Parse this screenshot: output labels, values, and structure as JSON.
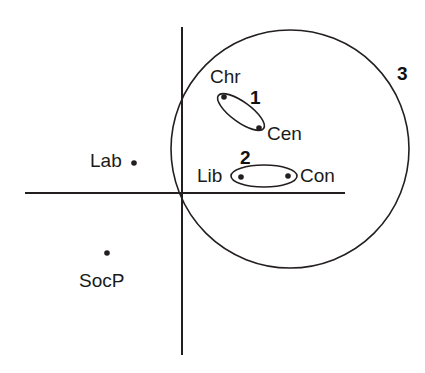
{
  "figure": {
    "background_color": "#ffffff",
    "stroke_color": "#231f20",
    "text_color": "#1a1a1a"
  },
  "chart_data": {
    "type": "scatter",
    "title": "",
    "xlabel": "",
    "ylabel": "",
    "grid": false,
    "legend": "none",
    "axes": {
      "type": "crossing-axes",
      "origin_px": [
        182,
        193
      ],
      "x_axis_px": [
        25,
        345
      ],
      "y_axis_px": [
        27,
        355
      ]
    },
    "xlim": [
      -1.0,
      1.0
    ],
    "ylim": [
      -1.0,
      1.0
    ],
    "points": [
      {
        "label": "Chr",
        "x_px": 224,
        "y_px": 97,
        "label_x_px": 210,
        "label_y_px": 67,
        "label_anchor": "above-left"
      },
      {
        "label": "Cen",
        "x_px": 259,
        "y_px": 128,
        "label_x_px": 267,
        "label_y_px": 124,
        "label_anchor": "right"
      },
      {
        "label": "Lib",
        "x_px": 241,
        "y_px": 177,
        "label_x_px": 197,
        "label_y_px": 166,
        "label_anchor": "left"
      },
      {
        "label": "Con",
        "x_px": 288,
        "y_px": 176,
        "label_x_px": 300,
        "label_y_px": 166,
        "label_anchor": "right"
      },
      {
        "label": "Lab",
        "x_px": 134,
        "y_px": 163,
        "label_x_px": 90,
        "label_y_px": 151,
        "label_anchor": "left"
      },
      {
        "label": "SocP",
        "x_px": 107,
        "y_px": 253,
        "label_x_px": 79,
        "label_y_px": 271,
        "label_anchor": "below"
      }
    ],
    "clusters": [
      {
        "id": "1",
        "shape": "ellipse",
        "members": [
          "Chr",
          "Cen"
        ],
        "cx_px": 241,
        "cy_px": 112,
        "rx_px": 28,
        "ry_px": 10,
        "rotation_deg": 36,
        "label_x_px": 250,
        "label_y_px": 88
      },
      {
        "id": "2",
        "shape": "ellipse",
        "members": [
          "Lib",
          "Con"
        ],
        "cx_px": 264,
        "cy_px": 176,
        "rx_px": 33,
        "ry_px": 11,
        "rotation_deg": 0,
        "label_x_px": 240,
        "label_y_px": 148
      },
      {
        "id": "3",
        "shape": "circle",
        "members": [
          "Chr",
          "Cen",
          "Lib",
          "Con"
        ],
        "cx_px": 290,
        "cy_px": 149,
        "r_px": 119,
        "label_x_px": 397,
        "label_y_px": 64
      }
    ]
  }
}
